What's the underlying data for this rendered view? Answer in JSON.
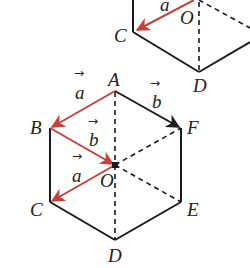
{
  "figure": {
    "colors": {
      "edge": "#1a1a1a",
      "vector": "#c8403a",
      "dashed": "#1a1a1a",
      "label": "#222222",
      "background": "#ffffff"
    },
    "top_partial": {
      "labels": {
        "C": "C",
        "O": "O",
        "D": "D",
        "a": "a"
      }
    },
    "bottom_hexagon": {
      "vertices": {
        "A": "A",
        "B": "B",
        "C": "C",
        "D": "D",
        "E": "E",
        "F": "F",
        "O": "O"
      },
      "vector_labels": {
        "a_AB": "a",
        "b_AF": "b",
        "b_BO": "b",
        "a_OC": "a"
      },
      "arrow_glyph": "→"
    }
  }
}
